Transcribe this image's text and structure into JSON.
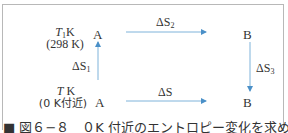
{
  "diagram": {
    "top_left_temp": "T",
    "top_left_temp_sub": "1",
    "top_left_unit": "K",
    "top_left_value": "(298 K)",
    "bottom_left_temp": "T",
    "bottom_left_unit": " K",
    "bottom_left_value": "(0 K付近)",
    "node_top_left": "A",
    "node_top_right": "B",
    "node_bottom_left": "A",
    "node_bottom_right": "B",
    "delta_left": "ΔS",
    "delta_left_sub": "1",
    "delta_top": "ΔS",
    "delta_top_sub": "2",
    "delta_right": "ΔS",
    "delta_right_sub": "3",
    "delta_bottom": "ΔS",
    "arrow_color": "#4a90c8"
  },
  "caption": "■ 図６−８　０K 付近のエントロピー変化を求める経路"
}
